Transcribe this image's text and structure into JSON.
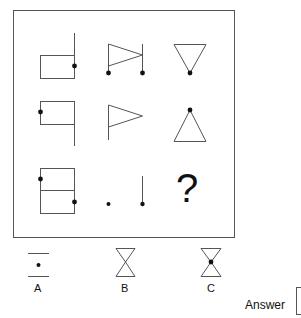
{
  "puzzle": {
    "grid": [
      [
        {
          "figure": "rectangle-with-right-vertical-line-extending-up",
          "dots": [
            "right-edge-middle"
          ]
        },
        {
          "figure": "flag-triangle-between-two-vertical-lines",
          "dots": [
            "left-bottom",
            "right-bottom"
          ]
        },
        {
          "figure": "inverted-triangle",
          "dots": [
            "bottom-vertex"
          ]
        }
      ],
      [
        {
          "figure": "rectangle-with-right-vertical-line-extending-down",
          "dots": [
            "left-edge-middle"
          ]
        },
        {
          "figure": "flag-triangle-on-pole",
          "dots": []
        },
        {
          "figure": "upright-triangle",
          "dots": [
            "top-vertex"
          ]
        }
      ],
      [
        {
          "figure": "rectangle-split-horizontally",
          "dots": [
            "left-edge-upper",
            "right-edge-lower"
          ]
        },
        {
          "figure": "dot-and-vertical-line",
          "dots": [
            "left-point",
            "line-bottom"
          ]
        },
        {
          "figure": "unknown",
          "label": "?"
        }
      ]
    ],
    "missing_label": "?"
  },
  "options": [
    {
      "label": "A",
      "figure": "two-horizontal-lines-with-center-dot"
    },
    {
      "label": "B",
      "figure": "hourglass"
    },
    {
      "label": "C",
      "figure": "hourglass-with-center-dot"
    }
  ],
  "answer": {
    "label": "Answer",
    "value": ""
  }
}
